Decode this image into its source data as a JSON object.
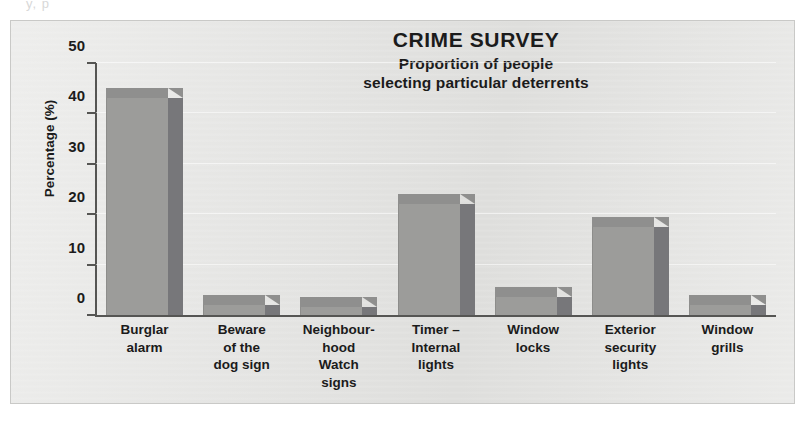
{
  "bleed_text": "y, p",
  "chart_data": {
    "type": "bar",
    "title": "CRIME SURVEY",
    "subtitle_line_1": "Proportion of people",
    "subtitle_line_2": "selecting particular deterrents",
    "xlabel": "",
    "ylabel": "Percentage (%)",
    "ylim": [
      0,
      50
    ],
    "ytick_labels": [
      "50",
      "40",
      "30",
      "20",
      "10",
      "0"
    ],
    "ytick_values": [
      50,
      40,
      30,
      20,
      10,
      0
    ],
    "grid": true,
    "legend": "none",
    "style": "3d-bar",
    "categories": [
      "Burglar alarm",
      "Beware of the dog sign",
      "Neighbourhood Watch signs",
      "Timer – Internal lights",
      "Window locks",
      "Exterior security lights",
      "Window grills"
    ],
    "category_label_lines": [
      [
        "Burglar",
        "alarm"
      ],
      [
        "Beware",
        "of the",
        "dog sign"
      ],
      [
        "Neighbour-",
        "hood",
        "Watch",
        "signs"
      ],
      [
        "Timer –",
        "Internal",
        "lights"
      ],
      [
        "Window",
        "locks"
      ],
      [
        "Exterior",
        "security",
        "lights"
      ],
      [
        "Window",
        "grills"
      ]
    ],
    "values": [
      43,
      2,
      1.5,
      22,
      3.5,
      17.5,
      2
    ]
  },
  "colors": {
    "panel_background": "#e6e6e4",
    "bar_front": "#9c9c9a",
    "bar_side": "#77777a",
    "bar_top": "#8f8f8e",
    "axis": "#555553",
    "text": "#1b1b1b",
    "gridline": "#ffffff"
  }
}
